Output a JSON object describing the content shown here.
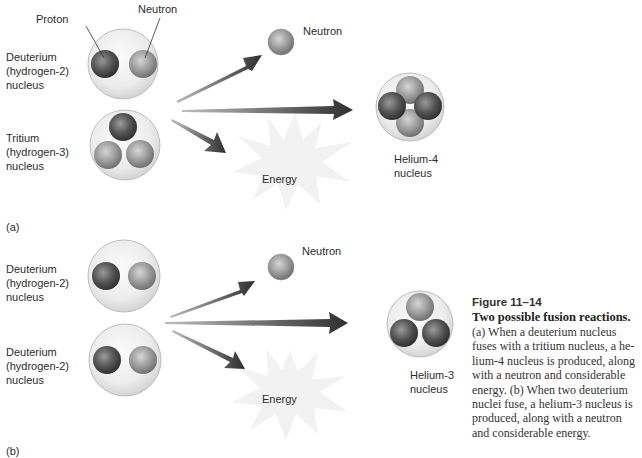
{
  "figure": {
    "number": "Figure 11–14",
    "title": "Two possible fusion reactions.",
    "body": "(a) When a deuterium nucleus fuses with a tritium nucleus, a he-lium-4 nucleus is produced, along with a neutron and considerable energy. (b) When two deuterium nuclei fuse, a helium-3 nucleus is produced, along with a neutron and considerable energy."
  },
  "panel_a": {
    "label": "(a)",
    "callouts": {
      "proton": "Proton",
      "neutron": "Neutron"
    },
    "reactant_1": "Deuterium\n(hydrogen-2)\nnucleus",
    "reactant_2": "Tritium\n(hydrogen-3)\nnucleus",
    "product_neutron": "Neutron",
    "product_energy": "Energy",
    "product_nucleus": "Helium-4\nnucleus"
  },
  "panel_b": {
    "label": "(b)",
    "reactant_1": "Deuterium\n(hydrogen-2)\nnucleus",
    "reactant_2": "Deuterium\n(hydrogen-2)\nnucleus",
    "product_neutron": "Neutron",
    "product_energy": "Energy",
    "product_nucleus": "Helium-3\nnucleus"
  },
  "colors": {
    "proton": "#5a5a5a",
    "neutron": "#9a9a9a",
    "nucleus_shell": "#e6e6e6",
    "arrow": "#3a3a3a",
    "energy_burst": "#f2f2f2"
  }
}
